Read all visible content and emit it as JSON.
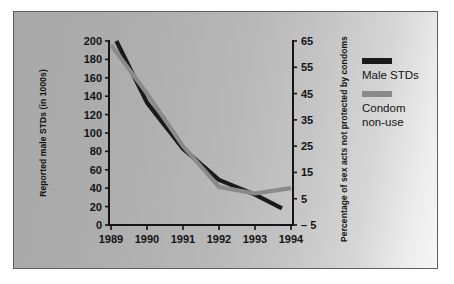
{
  "figure": {
    "panel_background_left": "#a9a9a9",
    "panel_background_right": "#f6f6f6",
    "panel_border_color": "#5d5d5d"
  },
  "chart_data": {
    "type": "line",
    "title": "",
    "subtitle": "",
    "xlabel": "",
    "x": [
      "1989",
      "1990",
      "1991",
      "1992",
      "1993",
      "1994"
    ],
    "xlim": [
      1989,
      1994
    ],
    "grid": false,
    "legend_position": "right",
    "axes": {
      "left": {
        "label": "Reported male STDs (in 1000s)",
        "ticks": [
          0,
          20,
          40,
          60,
          80,
          100,
          120,
          140,
          160,
          180,
          200
        ],
        "tick_labels": [
          "0",
          "20",
          "40",
          "60",
          "80",
          "100",
          "120",
          "140",
          "160",
          "180",
          "200"
        ],
        "lim": [
          0,
          200
        ]
      },
      "right": {
        "label": "Percentage of sex acts not protected by condoms",
        "ticks": [
          -5,
          5,
          15,
          25,
          35,
          45,
          55,
          65
        ],
        "tick_labels": [
          "– 5",
          "5",
          "15",
          "25",
          "35",
          "45",
          "55",
          "65"
        ],
        "lim": [
          -5,
          65
        ]
      }
    },
    "series": [
      {
        "name": "Male STDs",
        "color": "#1a1a1a",
        "axis": "left",
        "x": [
          1989.15,
          1990,
          1991,
          1992,
          1993,
          1993.75
        ],
        "values": [
          200,
          133,
          83,
          49,
          33,
          18
        ]
      },
      {
        "name": "Condom non-use",
        "color": "#8a8a8a",
        "axis": "right",
        "x": [
          1989,
          1990,
          1991,
          1992,
          1993,
          1994
        ],
        "values": [
          63.5,
          45,
          25,
          9.5,
          7,
          9
        ]
      }
    ],
    "legend": [
      {
        "label": "Male STDs",
        "color": "#1a1a1a"
      },
      {
        "label": "Condom non-use",
        "color": "#8a8a8a"
      }
    ]
  },
  "legend_text": {
    "item0": "Male STDs",
    "item1_line1": "Condom",
    "item1_line2": "non-use"
  }
}
